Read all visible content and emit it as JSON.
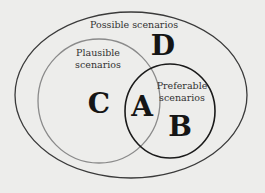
{
  "diagram": {
    "type": "venn",
    "background": "#ededeb",
    "sets": [
      {
        "id": "possible",
        "label": "Possible scenarios",
        "region_letter": "D",
        "stroke": "#3a3a3a"
      },
      {
        "id": "plausible",
        "label_line1": "Plausible",
        "label_line2": "scenarios",
        "region_letter": "C",
        "stroke": "#8a8a8a"
      },
      {
        "id": "preferable",
        "label_line1": "Preferable",
        "label_line2": "scenarios",
        "region_letter": "B",
        "stroke": "#1a1a1a"
      }
    ],
    "intersection": {
      "sets": [
        "plausible",
        "preferable"
      ],
      "region_letter": "A"
    }
  }
}
